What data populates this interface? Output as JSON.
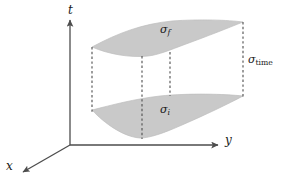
{
  "figure": {
    "type": "spacetime-slab-diagram",
    "background_color": "#ffffff",
    "surface_fill_color": "#c9c9c9",
    "surface_edge_color": "#b4b4b4",
    "axis_color": "#4d4d4d",
    "dashed_line_color": "#4d4d4d",
    "text_color": "#1a1a1a"
  },
  "axes": {
    "t": {
      "symbol": "t",
      "name": "time-axis",
      "direction": "up"
    },
    "y": {
      "symbol": "y",
      "name": "y-axis",
      "direction": "right"
    },
    "x": {
      "symbol": "x",
      "name": "x-axis",
      "direction": "down-left"
    },
    "origin": {
      "x": 70,
      "y": 145
    }
  },
  "surfaces": [
    {
      "name": "final-slice",
      "symbol": "σ",
      "subscript": "f",
      "subscript_style": "italic",
      "position": "upper",
      "label_x": 160,
      "label_y": 24
    },
    {
      "name": "initial-slice",
      "symbol": "σ",
      "subscript": "i",
      "subscript_style": "italic",
      "position": "lower",
      "label_x": 160,
      "label_y": 104
    }
  ],
  "annotations": [
    {
      "name": "time-extent",
      "symbol": "σ",
      "subscript": "time",
      "subscript_style": "roman",
      "label_x": 248,
      "label_y": 54
    }
  ],
  "dashed_connectors": [
    {
      "name": "left-connector",
      "x": 92,
      "y1": 47,
      "y2": 128
    },
    {
      "name": "mid-left-connector",
      "x": 142,
      "y1": 55,
      "y2": 137
    },
    {
      "name": "mid-right-connector",
      "x": 170,
      "y1": 57,
      "y2": 97
    },
    {
      "name": "right-connector",
      "x": 243,
      "y1": 22,
      "y2": 97
    }
  ]
}
